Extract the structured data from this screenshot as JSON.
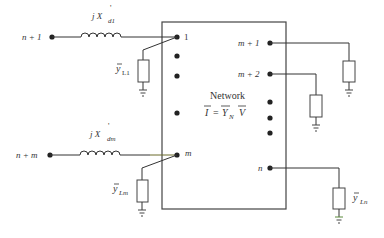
{
  "diagram": {
    "network_box": {
      "label": "Network",
      "equation": {
        "lhs": "I",
        "eq": "=",
        "rhs1": "Y",
        "rhs1_sub": "N",
        "rhs2": "V"
      }
    },
    "generator_branches": [
      {
        "external_node": "n + 1",
        "reactance": {
          "prefix": "j X",
          "prime": "'",
          "sub": "d1"
        },
        "internal_node": "1",
        "load": {
          "symbol": "y",
          "sub": "L1"
        }
      },
      {
        "external_node": "n + m",
        "reactance": {
          "prefix": "j X",
          "prime": "'",
          "sub": "dm"
        },
        "internal_node": "m",
        "load": {
          "symbol": "y",
          "sub": "Lm"
        }
      }
    ],
    "load_nodes": [
      {
        "label": "m + 1"
      },
      {
        "label": "m + 2"
      },
      {
        "label": "n",
        "load": {
          "symbol": "y",
          "sub": "Ln"
        }
      }
    ],
    "colors": {
      "line": "#333333",
      "box": "#444444",
      "accent_wire": "#6b6a2a",
      "ground_accent": "#5a8a3a"
    }
  }
}
